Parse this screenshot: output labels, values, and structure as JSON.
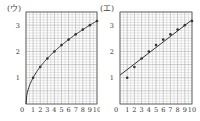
{
  "chart_data": [
    {
      "type": "scatter",
      "title": "(ウ)",
      "xlabel": "",
      "ylabel": "",
      "x_ticks": [
        "0",
        "1",
        "2",
        "3",
        "4",
        "5",
        "6",
        "7",
        "8",
        "9",
        "10"
      ],
      "y_ticks": [
        "0",
        "1",
        "2",
        "3"
      ],
      "xlim": [
        0,
        10
      ],
      "ylim": [
        0,
        3.5
      ],
      "grid": true,
      "points": {
        "x": [
          1,
          2,
          3,
          4,
          5,
          6,
          7,
          8,
          9,
          10
        ],
        "y": [
          1.0,
          1.41,
          1.73,
          2.0,
          2.24,
          2.45,
          2.65,
          2.83,
          3.0,
          3.16
        ]
      },
      "fit": {
        "kind": "curve",
        "formula": "y = sqrt(x)"
      }
    },
    {
      "type": "scatter",
      "title": "(エ)",
      "xlabel": "",
      "ylabel": "",
      "x_ticks": [
        "0",
        "1",
        "2",
        "3",
        "4",
        "5",
        "6",
        "7",
        "8",
        "9",
        "10"
      ],
      "y_ticks": [
        "0",
        "1",
        "2",
        "3"
      ],
      "xlim": [
        0,
        10
      ],
      "ylim": [
        0,
        3.5
      ],
      "grid": true,
      "points": {
        "x": [
          1,
          2,
          3,
          4,
          5,
          6,
          7,
          8,
          9,
          10
        ],
        "y": [
          1.0,
          1.41,
          1.73,
          2.0,
          2.24,
          2.45,
          2.65,
          2.83,
          3.0,
          3.16
        ]
      },
      "fit": {
        "kind": "line",
        "start": [
          0,
          1.1
        ],
        "end": [
          10,
          3.2
        ]
      }
    }
  ],
  "panels": [
    {
      "label": "(ウ)"
    },
    {
      "label": "(エ)"
    }
  ],
  "colors": {
    "grid": "#aaaaaa",
    "axis": "#555555",
    "ink": "#333333"
  }
}
